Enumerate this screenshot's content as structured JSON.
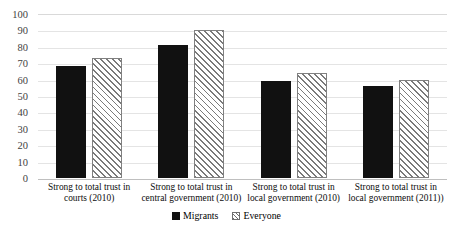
{
  "chart_data": {
    "type": "bar",
    "title": "",
    "subtitle": "",
    "xlabel": "",
    "ylabel": "",
    "ylim": [
      0,
      100
    ],
    "ytick_step": 10,
    "ytick_labels": [
      "100",
      "90",
      "80",
      "70",
      "60",
      "50",
      "40",
      "30",
      "20",
      "10",
      "0"
    ],
    "grid": true,
    "legend_position": "bottom-center",
    "categories": [
      "Strong to total trust in courts (2010)",
      "Strong to total trust in central government (2010)",
      "Strong to total trust in local government (2010)",
      "Strong to total trust in local government (2011))"
    ],
    "series": [
      {
        "name": "Migrants",
        "color": "#111111",
        "pattern": "solid",
        "values": [
          68,
          81,
          59,
          56
        ]
      },
      {
        "name": "Everyone",
        "color": "#ffffff",
        "pattern": "diagonal-hatch",
        "values": [
          73,
          90,
          64,
          60
        ]
      }
    ]
  },
  "yaxis": {
    "ticks": [
      {
        "label": "100",
        "value": 100
      },
      {
        "label": "90",
        "value": 90
      },
      {
        "label": "80",
        "value": 80
      },
      {
        "label": "70",
        "value": 70
      },
      {
        "label": "60",
        "value": 60
      },
      {
        "label": "50",
        "value": 50
      },
      {
        "label": "40",
        "value": 40
      },
      {
        "label": "30",
        "value": 30
      },
      {
        "label": "20",
        "value": 20
      },
      {
        "label": "10",
        "value": 10
      },
      {
        "label": "0",
        "value": 0
      }
    ]
  },
  "xaxis": {
    "labels": [
      {
        "line1": "Strong to total trust in",
        "line2": "courts (2010)"
      },
      {
        "line1": "Strong to total trust in",
        "line2": "central government (2010)"
      },
      {
        "line1": "Strong to total trust in",
        "line2": "local government (2010)"
      },
      {
        "line1": "Strong to total trust in",
        "line2": "local government (2011))"
      }
    ]
  },
  "legend": {
    "entries": [
      {
        "label": "Migrants",
        "swatch": "solid-black-square"
      },
      {
        "label": "Everyone",
        "swatch": "hatched-square"
      }
    ]
  },
  "colors": {
    "migrants_fill": "#111111",
    "everyone_fill": "#ffffff",
    "everyone_hatch": "#7a7a7a",
    "gridline": "#e4e4e4",
    "baseline": "#bfbfbf",
    "text": "#0d0d0d"
  }
}
